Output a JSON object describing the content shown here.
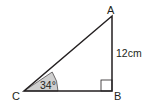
{
  "diagram": {
    "type": "right-triangle",
    "vertices": {
      "A": {
        "label": "A"
      },
      "B": {
        "label": "B"
      },
      "C": {
        "label": "C"
      }
    },
    "angle_C": {
      "label": "34°",
      "value_deg": 34
    },
    "side_AB": {
      "label": "12cm",
      "value": 12,
      "unit": "cm"
    },
    "right_angle_at": "B",
    "colors": {
      "stroke": "#231f20",
      "angle_fill": "#cfcfcf",
      "background": "#ffffff"
    }
  }
}
